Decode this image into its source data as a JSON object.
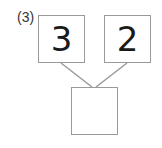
{
  "problem": {
    "label": "(3)",
    "parts": [
      "3",
      "2"
    ],
    "whole": ""
  },
  "colors": {
    "box_border": "#9a9a9a",
    "line": "#9a9a9a",
    "text": "#1a1a1a"
  }
}
